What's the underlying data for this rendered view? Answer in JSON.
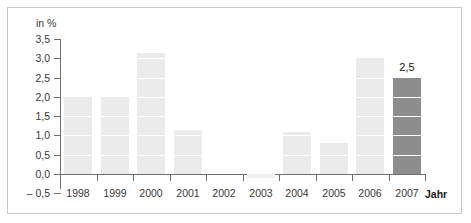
{
  "chart_data": {
    "type": "bar",
    "title": "",
    "xlabel": "Jahr",
    "ylabel": "in %",
    "categories": [
      "1998",
      "1999",
      "2000",
      "2001",
      "2002",
      "2003",
      "2004",
      "2005",
      "2006",
      "2007"
    ],
    "values": [
      2.0,
      2.0,
      3.15,
      1.15,
      0.0,
      -0.1,
      1.1,
      0.8,
      3.0,
      2.5
    ],
    "ylim": [
      -0.5,
      3.5
    ],
    "ytick_values": [
      3.5,
      3.0,
      2.5,
      2.0,
      1.5,
      1.0,
      0.5,
      0.0,
      -0.5
    ],
    "ytick_labels": [
      "3,5",
      "3,0",
      "2,5",
      "2,0",
      "1,5",
      "1,0",
      "0,5",
      "0,0",
      "– 0,5"
    ],
    "grid": false,
    "legend": "none",
    "data_labels": [
      {
        "category": "2007",
        "text": "2,5"
      }
    ],
    "highlight_category": "2007",
    "colors": {
      "bar_fill": "#ebebeb",
      "bar_highlight_fill": "#8d8d8d",
      "axis_line": "#6e6e6e",
      "text": "#3a3a3a",
      "frame_border": "#c8c8c8",
      "background": "#ffffff",
      "band_separator": "#ffffff"
    }
  }
}
